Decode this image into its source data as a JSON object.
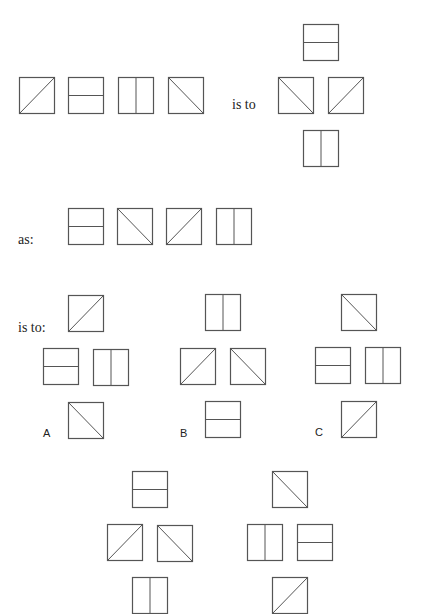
{
  "colors": {
    "background": "#ffffff",
    "stroke": "#555555",
    "text": "#222222"
  },
  "tile_types": {
    "diag-up": "square with diagonal from bottom-left to top-right",
    "diag-down": "square with diagonal from top-left to bottom-right",
    "horizontal": "square split by horizontal line",
    "vertical": "square split by vertical line"
  },
  "labels": {
    "is_to_1": "is to",
    "as": "as:",
    "is_to_2": "is to:",
    "option_a": "A",
    "option_b": "B",
    "option_c": "C"
  },
  "tiles": [
    {
      "group": "premise-row",
      "type": "diag-up",
      "x": 19,
      "y": 77
    },
    {
      "group": "premise-row",
      "type": "horizontal",
      "x": 68,
      "y": 77
    },
    {
      "group": "premise-row",
      "type": "vertical",
      "x": 118,
      "y": 77
    },
    {
      "group": "premise-row",
      "type": "diag-down",
      "x": 168,
      "y": 77
    },
    {
      "group": "premise-cross",
      "type": "horizontal",
      "x": 303,
      "y": 24
    },
    {
      "group": "premise-cross",
      "type": "diag-down",
      "x": 278,
      "y": 77
    },
    {
      "group": "premise-cross",
      "type": "diag-up",
      "x": 328,
      "y": 77
    },
    {
      "group": "premise-cross",
      "type": "vertical",
      "x": 303,
      "y": 130
    },
    {
      "group": "query-row",
      "type": "horizontal",
      "x": 68,
      "y": 208
    },
    {
      "group": "query-row",
      "type": "diag-down",
      "x": 117,
      "y": 208
    },
    {
      "group": "query-row",
      "type": "diag-up",
      "x": 166,
      "y": 208
    },
    {
      "group": "query-row",
      "type": "vertical",
      "x": 216,
      "y": 208
    },
    {
      "group": "option-a",
      "type": "diag-up",
      "x": 68,
      "y": 295
    },
    {
      "group": "option-a",
      "type": "horizontal",
      "x": 43,
      "y": 348
    },
    {
      "group": "option-a",
      "type": "vertical",
      "x": 93,
      "y": 349
    },
    {
      "group": "option-a",
      "type": "diag-down",
      "x": 68,
      "y": 402
    },
    {
      "group": "option-b",
      "type": "vertical",
      "x": 205,
      "y": 294
    },
    {
      "group": "option-b",
      "type": "diag-up",
      "x": 180,
      "y": 348
    },
    {
      "group": "option-b",
      "type": "diag-down",
      "x": 230,
      "y": 348
    },
    {
      "group": "option-b",
      "type": "horizontal",
      "x": 205,
      "y": 401
    },
    {
      "group": "option-c",
      "type": "diag-down",
      "x": 341,
      "y": 294
    },
    {
      "group": "option-c",
      "type": "horizontal",
      "x": 315,
      "y": 347
    },
    {
      "group": "option-c",
      "type": "vertical",
      "x": 365,
      "y": 347
    },
    {
      "group": "option-c",
      "type": "diag-up",
      "x": 341,
      "y": 401
    },
    {
      "group": "option-d",
      "type": "horizontal",
      "x": 132,
      "y": 471
    },
    {
      "group": "option-d",
      "type": "diag-up",
      "x": 107,
      "y": 524
    },
    {
      "group": "option-d",
      "type": "diag-down",
      "x": 157,
      "y": 525
    },
    {
      "group": "option-d",
      "type": "vertical",
      "x": 132,
      "y": 577
    },
    {
      "group": "option-e",
      "type": "diag-down",
      "x": 272,
      "y": 471
    },
    {
      "group": "option-e",
      "type": "vertical",
      "x": 247,
      "y": 524
    },
    {
      "group": "option-e",
      "type": "horizontal",
      "x": 297,
      "y": 524
    },
    {
      "group": "option-e",
      "type": "diag-up",
      "x": 272,
      "y": 577
    }
  ]
}
